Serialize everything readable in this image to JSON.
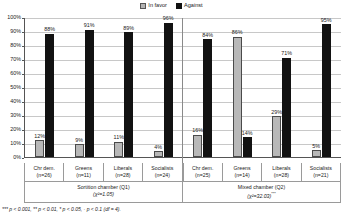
{
  "legend": {
    "items": [
      {
        "label": "In favor",
        "color": "#b8b8b8",
        "key": "favor"
      },
      {
        "label": "Against",
        "color": "#121212",
        "key": "against"
      }
    ]
  },
  "axis": {
    "y_ticks": [
      "100%",
      "90%",
      "80%",
      "70%",
      "60%",
      "50%",
      "40%",
      "30%",
      "20%",
      "10%",
      "0%"
    ]
  },
  "groups": [
    {
      "name": "Sortition chamber (Q1)",
      "stat": "(χ²=1.05)",
      "stat_stars": "",
      "categories": [
        {
          "label": "Chr dem.",
          "n": "(n=26)",
          "favor": "12%",
          "against": "88%"
        },
        {
          "label": "Greens",
          "n": "(n=11)",
          "favor": "9%",
          "against": "91%"
        },
        {
          "label": "Liberals",
          "n": "(n=28)",
          "favor": "11%",
          "against": "89%"
        },
        {
          "label": "Socialists",
          "n": "(n=24)",
          "favor": "4%",
          "against": "96%"
        }
      ]
    },
    {
      "name": "Mixed chamber (Q2)",
      "stat": "(χ²=32.03)",
      "stat_stars": "***",
      "categories": [
        {
          "label": "Chr dem.",
          "n": "(n=25)",
          "favor": "16%",
          "against": "84%"
        },
        {
          "label": "Greens",
          "n": "(n=14)",
          "favor": "86%",
          "against": "14%"
        },
        {
          "label": "Liberals",
          "n": "(n=28)",
          "favor": "29%",
          "against": "71%"
        },
        {
          "label": "Socialists",
          "n": "(n=21)",
          "favor": "5%",
          "against": "95%"
        }
      ]
    }
  ],
  "footnote": "*** p < 0.001,  ** p < 0.01,  * p < 0.05,  · p < 0.1 (df = 4).",
  "chart_data": {
    "type": "bar",
    "title": "",
    "xlabel": "",
    "ylabel": "",
    "ylim": [
      0,
      100
    ],
    "ytick_values": [
      0,
      10,
      20,
      30,
      40,
      50,
      60,
      70,
      80,
      90,
      100
    ],
    "grid": true,
    "legend_position": "top-center",
    "categories": [
      "Sortition chamber (Q1) / Chr dem. (n=26)",
      "Sortition chamber (Q1) / Greens (n=11)",
      "Sortition chamber (Q1) / Liberals (n=28)",
      "Sortition chamber (Q1) / Socialists (n=24)",
      "Mixed chamber (Q2) / Chr dem. (n=25)",
      "Mixed chamber (Q2) / Greens (n=14)",
      "Mixed chamber (Q2) / Liberals (n=28)",
      "Mixed chamber (Q2) / Socialists (n=21)"
    ],
    "series": [
      {
        "name": "In favor",
        "color": "#b8b8b8",
        "values": [
          12,
          9,
          11,
          4,
          16,
          86,
          29,
          5
        ]
      },
      {
        "name": "Against",
        "color": "#121212",
        "values": [
          88,
          91,
          89,
          96,
          84,
          14,
          71,
          95
        ]
      }
    ],
    "annotations": [
      "Sortition chamber (Q1): (χ²=1.05)",
      "Mixed chamber (Q2): (χ²=32.03)***",
      "*** p < 0.001,  ** p < 0.01,  * p < 0.05,  · p < 0.1 (df = 4)."
    ]
  }
}
